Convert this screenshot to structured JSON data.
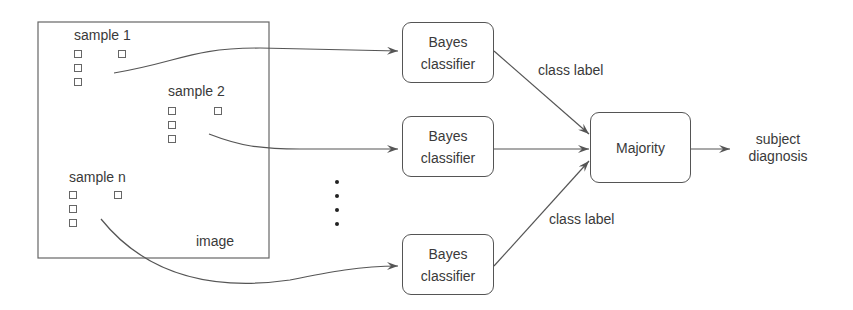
{
  "diagram": {
    "image_frame": {
      "label": "image"
    },
    "samples": [
      {
        "label": "sample 1"
      },
      {
        "label": "sample 2"
      },
      {
        "label": "sample n"
      }
    ],
    "classifiers": [
      {
        "line1": "Bayes",
        "line2": "classifier"
      },
      {
        "line1": "Bayes",
        "line2": "classifier"
      },
      {
        "line1": "Bayes",
        "line2": "classifier"
      }
    ],
    "edge_labels": {
      "top": "class label",
      "bottom": "class label"
    },
    "aggregator": {
      "label": "Majority"
    },
    "output": {
      "line1": "subject",
      "line2": "diagnosis"
    },
    "colors": {
      "stroke": "#555555",
      "text": "#3a3a3a",
      "background": "#ffffff"
    }
  }
}
